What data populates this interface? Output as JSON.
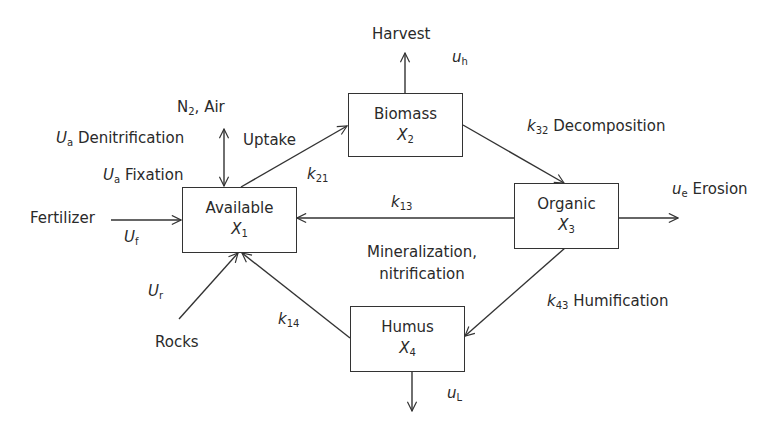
{
  "diagram": {
    "type": "flow-compartment",
    "nodes": [
      {
        "id": "X1",
        "name": "Available",
        "var": "X",
        "sub": "1"
      },
      {
        "id": "X2",
        "name": "Biomass",
        "var": "X",
        "sub": "2"
      },
      {
        "id": "X3",
        "name": "Organic",
        "var": "X",
        "sub": "3"
      },
      {
        "id": "X4",
        "name": "Humus",
        "var": "X",
        "sub": "4"
      }
    ],
    "edges": [
      {
        "from": "X1",
        "to": "X2",
        "label": "Uptake",
        "rate": "k",
        "rate_sub": "21"
      },
      {
        "from": "X2",
        "to": "X3",
        "label": "Decomposition",
        "rate": "k",
        "rate_sub": "32"
      },
      {
        "from": "X3",
        "to": "X1",
        "label": "Mineralization, nitrification",
        "rate": "k",
        "rate_sub": "13"
      },
      {
        "from": "X3",
        "to": "X4",
        "label": "Humification",
        "rate": "k",
        "rate_sub": "43"
      },
      {
        "from": "X4",
        "to": "X1",
        "label": "",
        "rate": "k",
        "rate_sub": "14"
      },
      {
        "from": "Fertilizer",
        "to": "X1",
        "label": "Fertilizer",
        "rate": "U",
        "rate_sub": "f"
      },
      {
        "from": "Rocks",
        "to": "X1",
        "label": "Rocks",
        "rate": "U",
        "rate_sub": "r"
      },
      {
        "from": "N2, Air",
        "to": "X1",
        "label": "Fixation / Denitrification",
        "rate": "U",
        "rate_sub": "a",
        "bidirectional": true
      },
      {
        "from": "X2",
        "to": "Harvest",
        "label": "Harvest",
        "rate": "u",
        "rate_sub": "h"
      },
      {
        "from": "X3",
        "to": "Erosion",
        "label": "Erosion",
        "rate": "u",
        "rate_sub": "e"
      },
      {
        "from": "X4",
        "to": "Leaching",
        "label": "",
        "rate": "u",
        "rate_sub": "L"
      }
    ]
  },
  "labels": {
    "harvest": "Harvest",
    "uh_var": "u",
    "uh_sub": "h",
    "n2_pre": "N",
    "n2_sub": "2",
    "n2_post": ", Air",
    "ua_var": "U",
    "ua_sub": "a",
    "denitrification": "Denitrification",
    "fixation": "Fixation",
    "uptake": "Uptake",
    "k21_var": "k",
    "k21_sub": "21",
    "k32_var": "k",
    "k32_sub": "32",
    "decomposition": "Decomposition",
    "fertilizer": "Fertilizer",
    "uf_var": "U",
    "uf_sub": "f",
    "k13_var": "k",
    "k13_sub": "13",
    "ue_var": "u",
    "ue_sub": "e",
    "erosion": "Erosion",
    "mineralization": "Mineralization,",
    "nitrification": "nitrification",
    "ur_var": "U",
    "ur_sub": "r",
    "rocks": "Rocks",
    "k14_var": "k",
    "k14_sub": "14",
    "k43_var": "k",
    "k43_sub": "43",
    "humification": "Humification",
    "ul_var": "u",
    "ul_sub": "L"
  },
  "boxes": {
    "available": {
      "name": "Available",
      "var": "X",
      "sub": "1"
    },
    "biomass": {
      "name": "Biomass",
      "var": "X",
      "sub": "2"
    },
    "organic": {
      "name": "Organic",
      "var": "X",
      "sub": "3"
    },
    "humus": {
      "name": "Humus",
      "var": "X",
      "sub": "4"
    }
  }
}
